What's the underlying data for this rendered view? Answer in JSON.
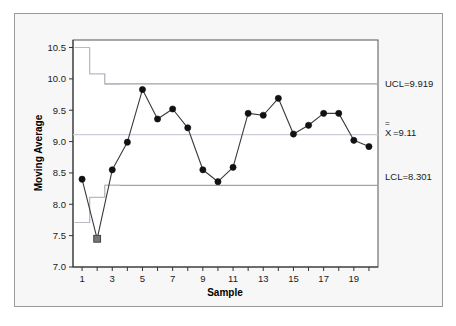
{
  "chart_data": {
    "type": "line",
    "title": "",
    "xlabel": "Sample",
    "ylabel": "Moving Average",
    "xlim": [
      0.4,
      20.6
    ],
    "ylim": [
      7.0,
      10.62
    ],
    "grid": false,
    "legend": null,
    "x": [
      1,
      2,
      3,
      4,
      5,
      6,
      7,
      8,
      9,
      10,
      11,
      12,
      13,
      14,
      15,
      16,
      17,
      18,
      19,
      20
    ],
    "xticks": [
      1,
      2,
      3,
      4,
      5,
      6,
      7,
      8,
      9,
      10,
      11,
      12,
      13,
      14,
      15,
      16,
      17,
      18,
      19,
      20
    ],
    "xtick_labels": [
      "1",
      "",
      "3",
      "",
      "5",
      "",
      "7",
      "",
      "9",
      "",
      "11",
      "",
      "13",
      "",
      "15",
      "",
      "17",
      "",
      "19",
      ""
    ],
    "yticks": [
      7.0,
      7.5,
      8.0,
      8.5,
      9.0,
      9.5,
      10.0,
      10.5
    ],
    "ytick_labels": [
      "7.0",
      "7.5",
      "8.0",
      "8.5",
      "9.0",
      "9.5",
      "10.0",
      "10.5"
    ],
    "series": [
      {
        "name": "Moving Average",
        "values": [
          8.4,
          7.45,
          8.55,
          8.99,
          9.83,
          9.36,
          9.52,
          9.22,
          8.55,
          8.36,
          8.59,
          9.45,
          9.42,
          9.69,
          9.12,
          9.26,
          9.45,
          9.45,
          9.02,
          8.92
        ]
      }
    ],
    "violations": [
      {
        "sample": 2,
        "value": 7.45,
        "reason": "below-lower-control-limit"
      }
    ],
    "center_line": 9.11,
    "upper_control_limit": 9.919,
    "lower_control_limit": 8.301,
    "ucl_steps": [
      {
        "sample": 1,
        "value": 10.5
      },
      {
        "sample": 2,
        "value": 10.08
      },
      {
        "sample": 3,
        "value": 9.919
      }
    ],
    "lcl_steps": [
      {
        "sample": 1,
        "value": 7.71
      },
      {
        "sample": 2,
        "value": 8.11
      },
      {
        "sample": 3,
        "value": 8.301
      }
    ]
  },
  "annotations": {
    "ucl_label": "UCL=9.919",
    "center_label_symbol": "X",
    "center_label_value": "=9.11",
    "lcl_label": "LCL=8.301"
  },
  "colors": {
    "background": "#f7f7f7",
    "plot_area": "#ffffff",
    "frame": "#9a9a9a",
    "axis": "#333333",
    "series_line": "#3a3a3a",
    "marker": "#111111",
    "violation_marker": "#777777",
    "control_limit": "#9aa3ae",
    "center_line": "#c8cdd4",
    "step_limit": "#b6bcc4",
    "text": "#1a1a1a"
  }
}
